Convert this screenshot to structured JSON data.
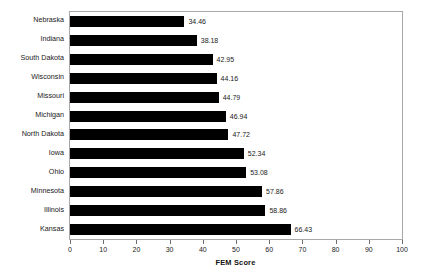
{
  "chart_data": {
    "type": "bar",
    "orientation": "horizontal",
    "title": "",
    "xlabel": "FEM Score",
    "ylabel": "",
    "xlim": [
      0,
      100
    ],
    "xticks": [
      0,
      10,
      20,
      30,
      40,
      50,
      60,
      70,
      80,
      90,
      100
    ],
    "grid": false,
    "legend": false,
    "bar_color": "#000000",
    "background_color": "#ffffff",
    "categories": [
      "Nebraska",
      "Indiana",
      "South Dakota",
      "Wisconsin",
      "Missouri",
      "Michigan",
      "North Dakota",
      "Iowa",
      "Ohio",
      "Minnesota",
      "Illinois",
      "Kansas"
    ],
    "values": [
      34.46,
      38.18,
      42.95,
      44.16,
      44.79,
      46.94,
      47.72,
      52.34,
      53.08,
      57.86,
      58.86,
      66.43
    ],
    "value_labels": [
      "34.46",
      "38.18",
      "42.95",
      "44.16",
      "44.79",
      "46.94",
      "47.72",
      "52.34",
      "53.08",
      "57.86",
      "58.86",
      "66.43"
    ],
    "tick_labels": [
      "0",
      "10",
      "20",
      "30",
      "40",
      "50",
      "60",
      "70",
      "80",
      "90",
      "100"
    ]
  }
}
